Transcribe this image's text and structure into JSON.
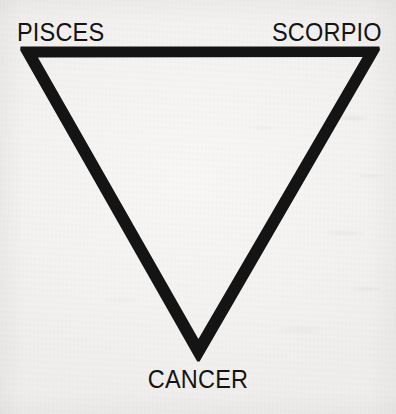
{
  "figure": {
    "background_color": "#f5f4f2",
    "ink_color": "#141414"
  },
  "diagram": {
    "type": "inverted-triangle",
    "stroke_width_px": 10,
    "vertices": [
      {
        "id": "top-left",
        "x": 21,
        "y": 47,
        "label_key": "pisces"
      },
      {
        "id": "top-right",
        "x": 379,
        "y": 47,
        "label_key": "scorpio"
      },
      {
        "id": "bottom-apex",
        "x": 198,
        "y": 360,
        "label_key": "cancer"
      }
    ]
  },
  "labels": {
    "pisces": "PISCES",
    "scorpio": "SCORPIO",
    "cancer": "CANCER"
  }
}
